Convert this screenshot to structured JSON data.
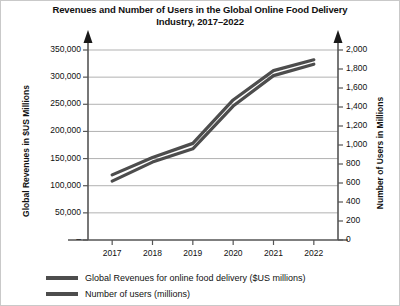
{
  "chart_data": {
    "type": "line",
    "title": "Revenues and Number of Users in the Global Online Food Delivery Industry, 2017–2022",
    "title_line1": "Revenues and Number of Users in the Global Online Food Delivery",
    "title_line2": "Industry, 2017–2022",
    "xlabel": "",
    "x": [
      "2017",
      "2018",
      "2019",
      "2020",
      "2021",
      "2022"
    ],
    "categories": [
      "2017",
      "2018",
      "2019",
      "2020",
      "2021",
      "2022"
    ],
    "grid": true,
    "legend_position": "bottom-left",
    "axes": [
      {
        "id": "left",
        "label": "Global Revenues in $US Millions",
        "ticks": [
          "50,000",
          "100,000",
          "150,000",
          "200,000",
          "250,000",
          "300,000",
          "350,000"
        ],
        "tick_values": [
          50000,
          100000,
          150000,
          200000,
          250000,
          300000,
          350000
        ],
        "lim": [
          0,
          350000
        ],
        "arrow": true
      },
      {
        "id": "right",
        "label": "Number of Users in Millions",
        "ticks": [
          "0",
          "200",
          "400",
          "600",
          "800",
          "1,000",
          "1,200",
          "1,400",
          "1,600",
          "1,800",
          "2,000"
        ],
        "tick_values": [
          0,
          200,
          400,
          600,
          800,
          1000,
          1200,
          1400,
          1600,
          1800,
          2000
        ],
        "lim": [
          0,
          2000
        ],
        "arrow": true
      }
    ],
    "series": [
      {
        "name": "Global Revenues for online food delivery ($US millions)",
        "axis": "left",
        "color": "#4d4d4d",
        "values": [
          120000,
          152000,
          178000,
          258000,
          312000,
          332000
        ]
      },
      {
        "name": "Number of users (millions)",
        "axis": "right",
        "color": "#4d4d4d",
        "values": [
          620,
          820,
          960,
          1410,
          1730,
          1850
        ]
      }
    ],
    "legend": [
      "Global Revenues for online food delivery ($US millions)",
      "Number of users (millions)"
    ]
  }
}
